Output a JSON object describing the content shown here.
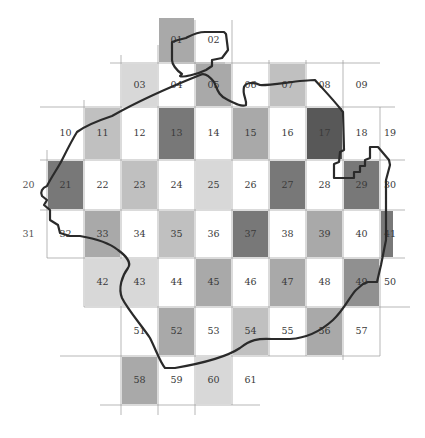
{
  "map": {
    "grid": {
      "origin_x": 47,
      "col_width": 37,
      "row_tops": [
        17,
        63,
        107,
        160,
        210,
        258,
        307,
        356,
        405
      ]
    },
    "shades": {
      "white": "#ffffff",
      "light": "#d6d6d6",
      "medium_light": "#bdbdbd",
      "medium": "#a4a4a4",
      "medium_dark": "#8a8a8a",
      "dark": "#717171",
      "very_dark": "#4f4f4f"
    },
    "cells": [
      {
        "label": "01",
        "col": 3,
        "row": 0,
        "shade": "medium"
      },
      {
        "label": "02",
        "col": 4,
        "row": 0,
        "shade": "white"
      },
      {
        "label": "03",
        "col": 2,
        "row": 1,
        "shade": "light"
      },
      {
        "label": "04",
        "col": 3,
        "row": 1,
        "shade": "white"
      },
      {
        "label": "05",
        "col": 4,
        "row": 1,
        "shade": "medium"
      },
      {
        "label": "06",
        "col": 5,
        "row": 1,
        "shade": "white"
      },
      {
        "label": "07",
        "col": 6,
        "row": 1,
        "shade": "medium_light"
      },
      {
        "label": "08",
        "col": 7,
        "row": 1,
        "shade": "white"
      },
      {
        "label": "09",
        "col": 8,
        "row": 1,
        "shade": "white"
      },
      {
        "label": "10",
        "col": 0,
        "row": 2,
        "shade": "white"
      },
      {
        "label": "11",
        "col": 1,
        "row": 2,
        "shade": "medium_light"
      },
      {
        "label": "12",
        "col": 2,
        "row": 2,
        "shade": "white"
      },
      {
        "label": "13",
        "col": 3,
        "row": 2,
        "shade": "dark"
      },
      {
        "label": "14",
        "col": 4,
        "row": 2,
        "shade": "white"
      },
      {
        "label": "15",
        "col": 5,
        "row": 2,
        "shade": "medium"
      },
      {
        "label": "16",
        "col": 6,
        "row": 2,
        "shade": "white"
      },
      {
        "label": "17",
        "col": 7,
        "row": 2,
        "shade": "very_dark"
      },
      {
        "label": "18",
        "col": 8,
        "row": 2,
        "shade": "white"
      },
      {
        "label": "19",
        "col": 9,
        "row": 2,
        "shade": "white"
      },
      {
        "label": "20",
        "col": -1,
        "row": 3,
        "shade": "white"
      },
      {
        "label": "21",
        "col": 0,
        "row": 3,
        "shade": "dark"
      },
      {
        "label": "22",
        "col": 1,
        "row": 3,
        "shade": "white"
      },
      {
        "label": "23",
        "col": 2,
        "row": 3,
        "shade": "medium_light"
      },
      {
        "label": "24",
        "col": 3,
        "row": 3,
        "shade": "white"
      },
      {
        "label": "25",
        "col": 4,
        "row": 3,
        "shade": "light"
      },
      {
        "label": "26",
        "col": 5,
        "row": 3,
        "shade": "white"
      },
      {
        "label": "27",
        "col": 6,
        "row": 3,
        "shade": "dark"
      },
      {
        "label": "28",
        "col": 7,
        "row": 3,
        "shade": "white"
      },
      {
        "label": "29",
        "col": 8,
        "row": 3,
        "shade": "dark"
      },
      {
        "label": "30",
        "col": 9,
        "row": 3,
        "shade": "white"
      },
      {
        "label": "31",
        "col": -1,
        "row": 4,
        "shade": "white"
      },
      {
        "label": "32",
        "col": 0,
        "row": 4,
        "shade": "white"
      },
      {
        "label": "33",
        "col": 1,
        "row": 4,
        "shade": "medium"
      },
      {
        "label": "34",
        "col": 2,
        "row": 4,
        "shade": "white"
      },
      {
        "label": "35",
        "col": 3,
        "row": 4,
        "shade": "medium_light"
      },
      {
        "label": "36",
        "col": 4,
        "row": 4,
        "shade": "white"
      },
      {
        "label": "37",
        "col": 5,
        "row": 4,
        "shade": "dark"
      },
      {
        "label": "38",
        "col": 6,
        "row": 4,
        "shade": "white"
      },
      {
        "label": "39",
        "col": 7,
        "row": 4,
        "shade": "medium"
      },
      {
        "label": "40",
        "col": 8,
        "row": 4,
        "shade": "white"
      },
      {
        "label": "41",
        "col": 9,
        "row": 4,
        "shade": "dark"
      },
      {
        "label": "42",
        "col": 1,
        "row": 5,
        "shade": "light"
      },
      {
        "label": "43",
        "col": 2,
        "row": 5,
        "shade": "light"
      },
      {
        "label": "44",
        "col": 3,
        "row": 5,
        "shade": "white"
      },
      {
        "label": "45",
        "col": 4,
        "row": 5,
        "shade": "medium"
      },
      {
        "label": "46",
        "col": 5,
        "row": 5,
        "shade": "white"
      },
      {
        "label": "47",
        "col": 6,
        "row": 5,
        "shade": "medium"
      },
      {
        "label": "48",
        "col": 7,
        "row": 5,
        "shade": "white"
      },
      {
        "label": "49",
        "col": 8,
        "row": 5,
        "shade": "medium_dark"
      },
      {
        "label": "50",
        "col": 9,
        "row": 5,
        "shade": "white"
      },
      {
        "label": "51",
        "col": 2,
        "row": 6,
        "shade": "white"
      },
      {
        "label": "52",
        "col": 3,
        "row": 6,
        "shade": "medium"
      },
      {
        "label": "53",
        "col": 4,
        "row": 6,
        "shade": "white"
      },
      {
        "label": "54",
        "col": 5,
        "row": 6,
        "shade": "medium_light"
      },
      {
        "label": "55",
        "col": 6,
        "row": 6,
        "shade": "white"
      },
      {
        "label": "56",
        "col": 7,
        "row": 6,
        "shade": "medium"
      },
      {
        "label": "57",
        "col": 8,
        "row": 6,
        "shade": "white"
      },
      {
        "label": "58",
        "col": 2,
        "row": 7,
        "shade": "medium"
      },
      {
        "label": "59",
        "col": 3,
        "row": 7,
        "shade": "white"
      },
      {
        "label": "60",
        "col": 4,
        "row": 7,
        "shade": "light"
      },
      {
        "label": "61",
        "col": 5,
        "row": 7,
        "shade": "white"
      }
    ]
  }
}
